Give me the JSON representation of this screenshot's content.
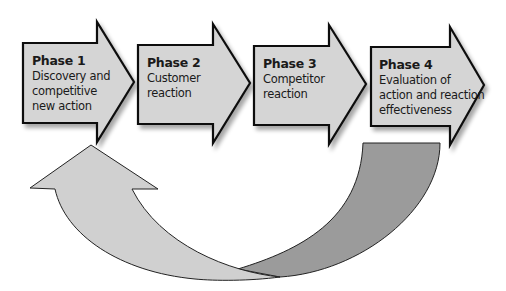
{
  "diagram": {
    "colors": {
      "phase_fill": "#d5d5d5",
      "outline": "#111111",
      "feedback_light": "#d0d0d0",
      "feedback_dark": "#9b9b9b",
      "background": "#ffffff"
    },
    "phases": [
      {
        "title": "Phase 1",
        "description": "Discovery and\ncompetitive\nnew action"
      },
      {
        "title": "Phase 2",
        "description": "Customer\nreaction"
      },
      {
        "title": "Phase 3",
        "description": "Competitor\nreaction"
      },
      {
        "title": "Phase 4",
        "description": "Evaluation of\naction and reaction\neffectiveness"
      }
    ],
    "feedback_loop": {
      "from": "Phase 4",
      "to": "Phase 1",
      "shape": "curved-arrow"
    }
  }
}
